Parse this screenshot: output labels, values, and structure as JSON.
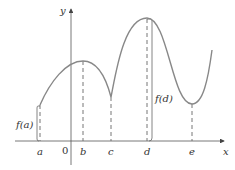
{
  "diagram": {
    "type": "function-graph",
    "axes": {
      "x_label": "x",
      "y_label": "y",
      "origin_label": "0"
    },
    "points": [
      {
        "name": "a",
        "label": "a",
        "kind": "left endpoint"
      },
      {
        "name": "b",
        "label": "b",
        "kind": "local maximum"
      },
      {
        "name": "c",
        "label": "c",
        "kind": "cusp / local minimum"
      },
      {
        "name": "d",
        "label": "d",
        "kind": "absolute maximum"
      },
      {
        "name": "e",
        "label": "e",
        "kind": "local minimum"
      }
    ],
    "annotations": {
      "fa": "f(a)",
      "fd": "f(d)"
    },
    "colors": {
      "curve": "#777777",
      "axis": "#444444",
      "text": "#333333"
    }
  }
}
